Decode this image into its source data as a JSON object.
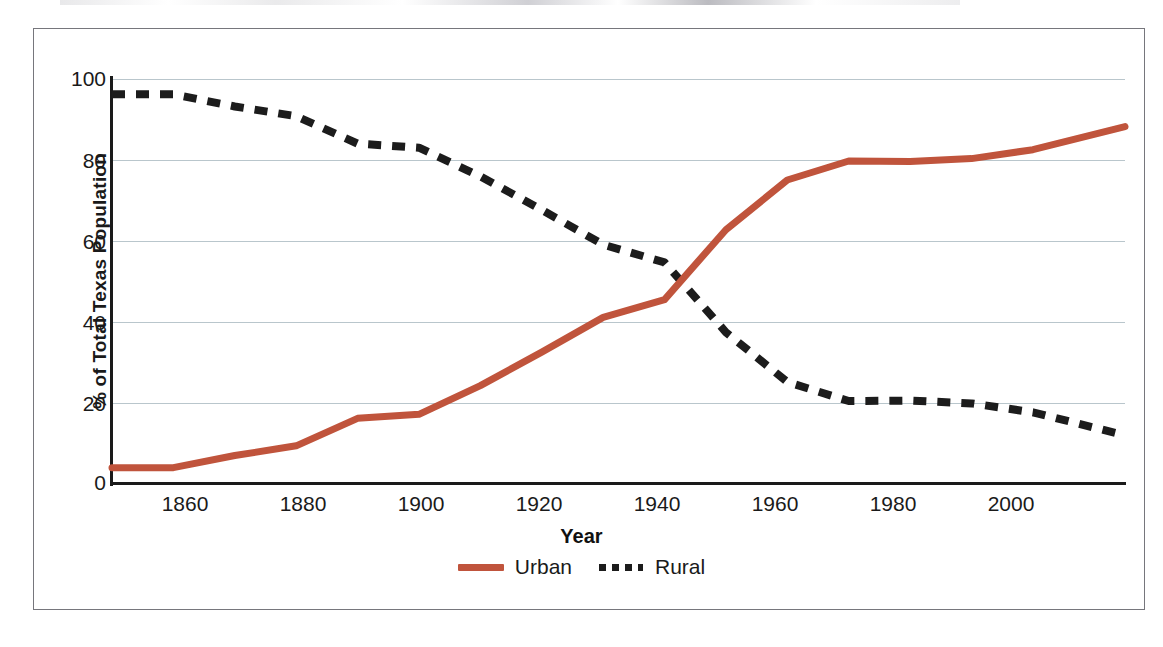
{
  "chart_data": {
    "type": "line",
    "title": "",
    "xlabel": "Year",
    "ylabel": "% of Total Texas Population",
    "xlim": [
      1850,
      2015
    ],
    "ylim": [
      0,
      100
    ],
    "yticks": [
      0,
      20,
      40,
      60,
      80,
      100
    ],
    "xticks": [
      1860,
      1880,
      1900,
      1920,
      1940,
      1960,
      1980,
      2000
    ],
    "grid": "horizontal",
    "legend_position": "bottom-center",
    "x": [
      1850,
      1860,
      1870,
      1880,
      1890,
      1900,
      1910,
      1920,
      1930,
      1940,
      1950,
      1960,
      1970,
      1980,
      1990,
      2000,
      2015
    ],
    "series": [
      {
        "name": "Urban",
        "color": "#C0543C",
        "style": "solid",
        "values": [
          3.8,
          3.8,
          6.8,
          9.2,
          16.0,
          17.0,
          24.1,
          32.4,
          41.0,
          45.4,
          62.7,
          75.0,
          79.7,
          79.6,
          80.3,
          82.5,
          88.2
        ]
      },
      {
        "name": "Rural",
        "color": "#1c1c1c",
        "style": "dashed",
        "values": [
          96.2,
          96.2,
          93.2,
          90.8,
          84.0,
          83.0,
          75.9,
          67.6,
          59.0,
          54.6,
          37.3,
          25.0,
          20.3,
          20.4,
          19.7,
          17.5,
          11.8
        ]
      }
    ],
    "legend": [
      {
        "label": "Urban",
        "color": "#C0543C",
        "style": "solid"
      },
      {
        "label": "Rural",
        "color": "#1c1c1c",
        "style": "dashed"
      }
    ]
  },
  "axes": {
    "y_label": "% of Total Texas Population",
    "x_label": "Year",
    "y_tick_labels": [
      "100",
      "80",
      "60",
      "40",
      "20",
      "0"
    ],
    "x_tick_labels": [
      "1860",
      "1880",
      "1900",
      "1920",
      "1940",
      "1960",
      "1980",
      "2000"
    ]
  },
  "legend": {
    "urban_label": "Urban",
    "rural_label": "Rural"
  },
  "colors": {
    "urban": "#C0543C",
    "rural": "#1c1c1c",
    "gridline": "#b9c6cc",
    "axis": "#1a1a1a",
    "frame": "#76767c",
    "background": "#ffffff"
  }
}
